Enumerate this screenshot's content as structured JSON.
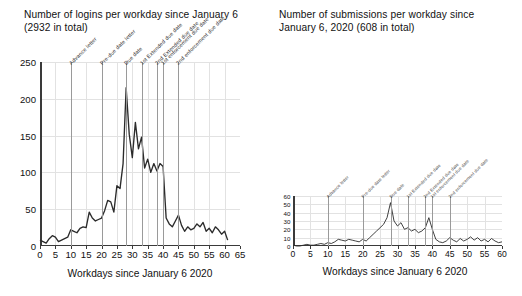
{
  "chart_data": [
    {
      "id": "logins",
      "type": "line",
      "title": "Number of logins per workday since January 6\n(2932 in total)",
      "xlabel": "Workdays since January 6 2020",
      "ylabel": "",
      "xlim": [
        0,
        65
      ],
      "ylim": [
        0,
        250
      ],
      "xticks": [
        0,
        5,
        10,
        15,
        20,
        25,
        30,
        35,
        40,
        45,
        50,
        55,
        60,
        65
      ],
      "yticks": [
        0,
        50,
        100,
        150,
        200,
        250
      ],
      "ytick_labels": [
        "0",
        "50",
        "100",
        "150",
        "200",
        "250"
      ],
      "grid": true,
      "legend": "none",
      "line_color": "#2b2b2b",
      "event_line_color": "#9a9a9a",
      "events": [
        {
          "x": 10,
          "label": "Advance letter"
        },
        {
          "x": 20,
          "label": "Pre-due date letter"
        },
        {
          "x": 28,
          "label": "Due date"
        },
        {
          "x": 33,
          "label": "1st Extended due date"
        },
        {
          "x": 38,
          "label": "2nd Extended due date"
        },
        {
          "x": 40,
          "label": "1st enforcement due date"
        },
        {
          "x": 45,
          "label": "2nd enforcement due date"
        }
      ],
      "x": [
        0,
        1,
        2,
        3,
        4,
        5,
        6,
        7,
        8,
        9,
        10,
        11,
        12,
        13,
        14,
        15,
        16,
        17,
        18,
        19,
        20,
        21,
        22,
        23,
        24,
        25,
        26,
        27,
        28,
        29,
        30,
        31,
        32,
        33,
        34,
        35,
        36,
        37,
        38,
        39,
        40,
        41,
        42,
        43,
        44,
        45,
        46,
        47,
        48,
        49,
        50,
        51,
        52,
        53,
        54,
        55,
        56,
        57,
        58,
        59,
        60,
        61
      ],
      "values": [
        8,
        6,
        4,
        10,
        14,
        12,
        6,
        8,
        10,
        12,
        22,
        20,
        18,
        24,
        26,
        25,
        46,
        38,
        34,
        36,
        38,
        48,
        62,
        60,
        46,
        82,
        78,
        112,
        215,
        152,
        120,
        168,
        132,
        148,
        106,
        118,
        100,
        112,
        102,
        112,
        108,
        38,
        30,
        26,
        34,
        42,
        28,
        20,
        26,
        22,
        24,
        30,
        26,
        32,
        20,
        24,
        18,
        26,
        22,
        16,
        20,
        8
      ]
    },
    {
      "id": "submissions",
      "type": "line",
      "title": "Number of submissions per workday since\nJanuary 6, 2020 (608 in total)",
      "xlabel": "Workdays since January 6 2020",
      "ylabel": "",
      "xlim": [
        0,
        60
      ],
      "ylim": [
        0,
        60
      ],
      "xticks": [
        0,
        5,
        10,
        15,
        20,
        25,
        30,
        35,
        40,
        45,
        50,
        55,
        60
      ],
      "yticks": [
        0,
        10,
        20,
        30,
        40,
        50,
        60
      ],
      "ytick_labels": [
        "0",
        "10",
        "20",
        "30",
        "40",
        "50",
        "60"
      ],
      "grid": true,
      "legend": "none",
      "line_color": "#2b2b2b",
      "event_line_color": "#9a9a9a",
      "events": [
        {
          "x": 10,
          "label": "Advance letter"
        },
        {
          "x": 20,
          "label": "Pre-due date letter"
        },
        {
          "x": 28,
          "label": "Due date"
        },
        {
          "x": 33,
          "label": "1st Extended due date"
        },
        {
          "x": 38,
          "label": "2nd Extended due date"
        },
        {
          "x": 40,
          "label": "1st enforcement due date"
        },
        {
          "x": 45,
          "label": "2nd enforcement due date"
        }
      ],
      "x": [
        0,
        1,
        2,
        3,
        4,
        5,
        6,
        7,
        8,
        9,
        10,
        11,
        12,
        13,
        14,
        15,
        16,
        17,
        18,
        19,
        20,
        21,
        22,
        23,
        24,
        25,
        26,
        27,
        28,
        29,
        30,
        31,
        32,
        33,
        34,
        35,
        36,
        37,
        38,
        39,
        40,
        41,
        42,
        43,
        44,
        45,
        46,
        47,
        48,
        49,
        50,
        51,
        52,
        53,
        54,
        55,
        56,
        57,
        58,
        59,
        60
      ],
      "values": [
        1,
        0,
        0,
        1,
        2,
        1,
        1,
        2,
        3,
        2,
        4,
        3,
        5,
        8,
        7,
        6,
        8,
        7,
        6,
        5,
        8,
        6,
        10,
        14,
        18,
        22,
        26,
        34,
        52,
        30,
        24,
        28,
        20,
        22,
        18,
        20,
        16,
        18,
        22,
        34,
        20,
        8,
        5,
        4,
        6,
        10,
        7,
        5,
        9,
        6,
        8,
        11,
        7,
        10,
        6,
        8,
        5,
        9,
        6,
        4,
        5
      ]
    }
  ]
}
